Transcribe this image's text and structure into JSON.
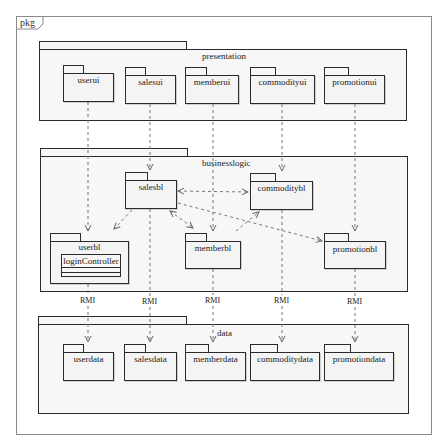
{
  "frame": {
    "label": "pkg"
  },
  "packages": {
    "presentation": {
      "label": "presentation",
      "children": [
        "userui",
        "salesui",
        "memberui",
        "commodityui",
        "promotionui"
      ]
    },
    "businesslogic": {
      "label": "businesslogic",
      "children": [
        "salesbl",
        "commoditybl",
        "userbl",
        "memberbl",
        "promotionbl"
      ],
      "userbl_class": "loginController"
    },
    "data": {
      "label": "data",
      "children": [
        "userdata",
        "salesdata",
        "memberdata",
        "commoditydata",
        "promotiondata"
      ]
    }
  },
  "labels": {
    "userui": "userui",
    "salesui": "salesui",
    "memberui": "memberui",
    "commodityui": "commodityui",
    "promotionui": "promotionui",
    "salesbl": "salesbl",
    "commoditybl": "commoditybl",
    "userbl": "userbl",
    "memberbl": "memberbl",
    "promotionbl": "promotionbl",
    "userdata": "userdata",
    "salesdata": "salesdata",
    "memberdata": "memberdata",
    "commoditydata": "commoditydata",
    "promotiondata": "promotiondata",
    "loginController": "loginController"
  },
  "connector_label": "RMI",
  "rmi_labels": [
    "RMI",
    "RMI",
    "RMI",
    "RMI",
    "RMI"
  ],
  "dependencies": [
    {
      "from": "userui",
      "to": "userbl",
      "style": "dashed-open-arrow"
    },
    {
      "from": "salesui",
      "to": "salesbl",
      "style": "dashed-open-arrow"
    },
    {
      "from": "memberui",
      "to": "memberbl",
      "style": "dashed-open-arrow"
    },
    {
      "from": "commodityui",
      "to": "commoditybl",
      "style": "dashed-open-arrow"
    },
    {
      "from": "promotionui",
      "to": "promotionbl",
      "style": "dashed-open-arrow"
    },
    {
      "from": "salesbl",
      "to": "commoditybl",
      "style": "dashed-bidirectional"
    },
    {
      "from": "salesbl",
      "to": "memberbl",
      "style": "dashed-bidirectional"
    },
    {
      "from": "salesbl",
      "to": "userbl",
      "style": "dashed-open-arrow"
    },
    {
      "from": "salesbl",
      "to": "promotionbl",
      "style": "dashed-open-arrow"
    },
    {
      "from": "memberbl",
      "to": "commoditybl",
      "style": "dashed-open-arrow"
    },
    {
      "from": "userbl",
      "to": "userdata",
      "style": "dashed-open-arrow",
      "label": "RMI"
    },
    {
      "from": "salesbl",
      "to": "salesdata",
      "style": "dashed-open-arrow",
      "label": "RMI"
    },
    {
      "from": "memberbl",
      "to": "memberdata",
      "style": "dashed-open-arrow",
      "label": "RMI"
    },
    {
      "from": "commoditybl",
      "to": "commoditydata",
      "style": "dashed-open-arrow",
      "label": "RMI"
    },
    {
      "from": "promotionbl",
      "to": "promotiondata",
      "style": "dashed-open-arrow",
      "label": "RMI"
    }
  ],
  "colors": {
    "stroke": "#2b2b2b",
    "fill": "#f6f6f6",
    "frame": "#8a8a8a",
    "dash": "#777777"
  }
}
